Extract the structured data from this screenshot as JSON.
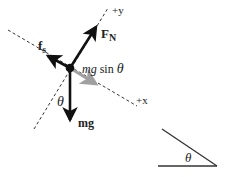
{
  "diagram": {
    "type": "free-body-diagram",
    "axes": {
      "y_label": "+y",
      "x_label": "+x"
    },
    "forces": [
      {
        "id": "normal",
        "label_main": "F",
        "label_sub": "N",
        "color": "#111111"
      },
      {
        "id": "friction",
        "label_main": "f",
        "label_sub": "s",
        "color": "#111111"
      },
      {
        "id": "weight",
        "label": "mg",
        "color": "#111111"
      },
      {
        "id": "component",
        "label_italic": "mg",
        "label_rest": " sin ",
        "label_theta": "θ",
        "color": "#a0a0a0"
      }
    ],
    "angle_label": "θ",
    "incline": {
      "angle_label": "θ"
    }
  },
  "colors": {
    "arrow": "#111111",
    "component_arrow": "#a0a0a0",
    "dashed_axis": "#333333",
    "background": "#ffffff"
  }
}
